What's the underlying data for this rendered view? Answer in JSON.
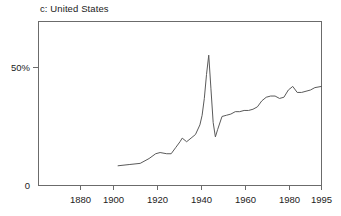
{
  "chart_data": {
    "type": "line",
    "title": "c: United States",
    "xlabel": "",
    "ylabel": "",
    "grid": false,
    "legend": false,
    "xlim": [
      1867,
      1995
    ],
    "ylim": [
      0,
      68
    ],
    "xticks": [
      1880,
      1900,
      1920,
      1940,
      1960,
      1980,
      1995
    ],
    "xtick_labels": [
      "1880",
      "1900",
      "1920",
      "1940",
      "1960",
      "1980",
      "1995"
    ],
    "yticks": [
      0,
      50
    ],
    "ytick_labels": [
      "0",
      "50%"
    ],
    "series": [
      {
        "name": "United States",
        "x": [
          1903,
          1908,
          1913,
          1917,
          1920,
          1922,
          1925,
          1927,
          1929,
          1931,
          1932,
          1934,
          1936,
          1938,
          1940,
          1941,
          1942,
          1943,
          1944,
          1945,
          1946,
          1947,
          1948,
          1950,
          1952,
          1954,
          1956,
          1958,
          1960,
          1962,
          1964,
          1966,
          1968,
          1970,
          1972,
          1974,
          1976,
          1978,
          1980,
          1982,
          1984,
          1986,
          1988,
          1990,
          1992,
          1995
        ],
        "values": [
          8.0,
          8.5,
          9.0,
          11.0,
          13.0,
          13.5,
          13.0,
          13.0,
          15.5,
          18.0,
          19.5,
          18.0,
          19.5,
          21.0,
          25.0,
          29.0,
          36.0,
          46.0,
          54.0,
          40.0,
          26.0,
          20.0,
          23.0,
          28.5,
          29.0,
          29.5,
          30.5,
          30.5,
          31.0,
          31.0,
          31.5,
          32.5,
          35.0,
          36.5,
          37.0,
          37.0,
          36.0,
          36.5,
          39.5,
          41.0,
          38.5,
          38.5,
          39.0,
          39.5,
          40.5,
          41.0
        ]
      }
    ]
  },
  "axis": {
    "y_label_top": "50%",
    "y_label_bottom": "0"
  }
}
